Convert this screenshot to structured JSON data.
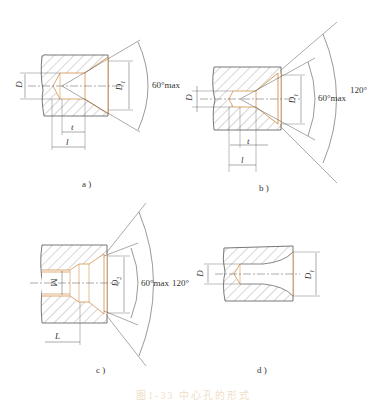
{
  "figure": {
    "caption_partial": "图1-33 中心孔的形式",
    "panels": [
      {
        "id": "a",
        "label": "a )",
        "dims": {
          "D": "D",
          "D1": "D",
          "D1_sub": "1",
          "t": "t",
          "l": "l"
        },
        "angles": [
          "60°max"
        ]
      },
      {
        "id": "b",
        "label": "b )",
        "dims": {
          "D": "D",
          "D1": "D",
          "D1_sub": "1",
          "t": "t",
          "l": "l"
        },
        "angles": [
          "60°max",
          "120°"
        ]
      },
      {
        "id": "c",
        "label": "c )",
        "dims": {
          "M": "M",
          "D2": "D",
          "D2_sub": "2",
          "L": "L"
        },
        "angles": [
          "60°max",
          "120°"
        ]
      },
      {
        "id": "d",
        "label": "d )",
        "dims": {
          "D": "D",
          "D1": "D",
          "D1_sub": "1"
        },
        "angles": []
      }
    ]
  },
  "colors": {
    "line": "#555555",
    "hatch": "#777777",
    "accent": "#d4914a"
  }
}
